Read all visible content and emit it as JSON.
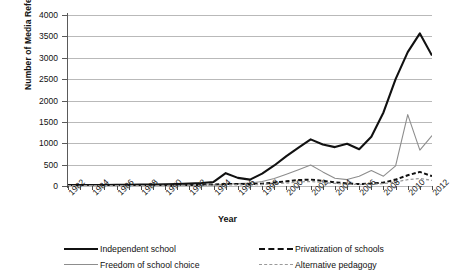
{
  "chart_data": {
    "type": "line",
    "title": "",
    "xlabel": "Year",
    "ylabel": "Number of Media References",
    "ylim": [
      0,
      4000
    ],
    "xlim": [
      1982,
      2012
    ],
    "yticks": [
      0,
      500,
      1000,
      1500,
      2000,
      2500,
      3000,
      3500,
      4000
    ],
    "ytick_labels": [
      "0",
      "500",
      "1000",
      "1500",
      "2000",
      "2500",
      "3000",
      "3500",
      "4000"
    ],
    "grid": "horizontal",
    "legend_position": "bottom",
    "x": [
      1982,
      1983,
      1984,
      1985,
      1986,
      1987,
      1988,
      1989,
      1990,
      1991,
      1992,
      1993,
      1994,
      1995,
      1996,
      1997,
      1998,
      1999,
      2000,
      2001,
      2002,
      2003,
      2004,
      2005,
      2006,
      2007,
      2008,
      2009,
      2010,
      2011,
      2012
    ],
    "xtick_labels": [
      "1982",
      "1984",
      "1986",
      "1988",
      "1990",
      "1992",
      "1994",
      "1996",
      "1998",
      "2000",
      "2002",
      "2004",
      "2006",
      "2008",
      "2010",
      "2012"
    ],
    "series": [
      {
        "name": "Independent school",
        "style": "solid",
        "color": "#111111",
        "width": 2.1,
        "values": [
          20,
          22,
          25,
          25,
          28,
          30,
          32,
          35,
          40,
          45,
          55,
          70,
          95,
          300,
          190,
          150,
          290,
          480,
          700,
          900,
          1090,
          970,
          910,
          990,
          860,
          1150,
          1720,
          2500,
          3130,
          3570,
          3050
        ]
      },
      {
        "name": "Freedom of school choice",
        "style": "solid",
        "color": "#8d8d8d",
        "width": 1.1,
        "values": [
          8,
          9,
          9,
          10,
          10,
          11,
          12,
          12,
          14,
          16,
          18,
          22,
          30,
          45,
          55,
          70,
          105,
          175,
          275,
          380,
          490,
          330,
          180,
          150,
          230,
          360,
          230,
          470,
          1670,
          840,
          1180
        ]
      },
      {
        "name": "Privatization of schools",
        "style": "dashed",
        "color": "#111111",
        "width": 2.0,
        "values": [
          12,
          12,
          13,
          13,
          14,
          15,
          15,
          16,
          18,
          20,
          24,
          28,
          35,
          45,
          48,
          42,
          55,
          80,
          110,
          140,
          150,
          120,
          85,
          60,
          45,
          55,
          80,
          150,
          250,
          330,
          230
        ]
      },
      {
        "name": "Alternative pedagogy",
        "style": "dashed",
        "color": "#9a9a9a",
        "width": 1.3,
        "values": [
          6,
          6,
          7,
          7,
          7,
          8,
          8,
          9,
          10,
          11,
          12,
          14,
          18,
          24,
          28,
          26,
          35,
          50,
          70,
          95,
          105,
          85,
          60,
          45,
          35,
          40,
          55,
          95,
          150,
          175,
          130
        ]
      }
    ],
    "notes": {
      "independent_school_peak": {
        "year": 2011,
        "value": 3570
      },
      "independent_school_end": {
        "year": 2012,
        "value": 3380
      },
      "freedom_peak": {
        "year": 2010,
        "value": 1670
      }
    }
  },
  "legend": {
    "items": [
      {
        "label": "Independent school",
        "sample": "solid-thick"
      },
      {
        "label": "Privatization of schools",
        "sample": "dash-dark"
      },
      {
        "label": "Freedom of school choice",
        "sample": "solid-thin"
      },
      {
        "label": "Alternative pedagogy",
        "sample": "dash-gray"
      }
    ]
  }
}
